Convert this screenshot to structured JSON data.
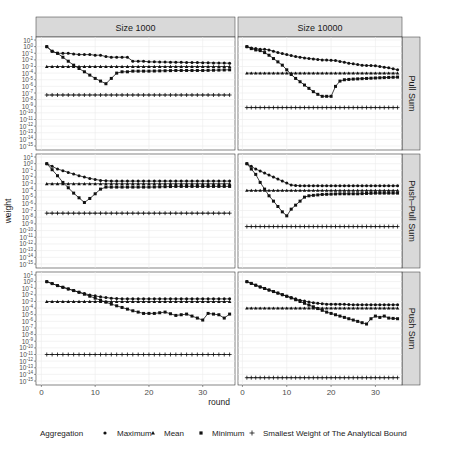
{
  "chart_data": {
    "type": "scatter",
    "xlabel": "round",
    "ylabel": "weight",
    "yscale": "log10",
    "ylim_exp": [
      -15,
      1
    ],
    "yticks_exp": [
      1,
      0,
      -1,
      -2,
      -3,
      -4,
      -5,
      -6,
      -7,
      -8,
      -9,
      -10,
      -11,
      -12,
      -13,
      -14,
      -15
    ],
    "xticks": [
      0,
      10,
      20,
      30
    ],
    "xlim": [
      -1,
      36
    ],
    "col_facets": [
      "Size 1000",
      "Size 10000"
    ],
    "row_facets": [
      "Pull Sum",
      "Push–Pull Sum",
      "Push Sum"
    ],
    "legend": {
      "title": "Aggregation",
      "position": "bottom",
      "entries": [
        {
          "name": "Maximum",
          "shape": "circle"
        },
        {
          "name": "Mean",
          "shape": "triangle"
        },
        {
          "name": "Minimum",
          "shape": "square"
        },
        {
          "name": "Smallest Weight of The Analytical Bound",
          "shape": "plus"
        }
      ]
    },
    "rounds": [
      1,
      35
    ],
    "panels": [
      {
        "row": "Pull Sum",
        "col": "Size 1000",
        "mean_exp": -3,
        "bound_exp": -7.3,
        "max_exp_points": [
          [
            1,
            0
          ],
          [
            2,
            -0.7
          ],
          [
            3,
            -1
          ],
          [
            4,
            -1
          ],
          [
            5,
            -1
          ],
          [
            6,
            -1.1
          ],
          [
            7,
            -1.2
          ],
          [
            8,
            -1.2
          ],
          [
            9,
            -1.2
          ],
          [
            10,
            -1.3
          ],
          [
            11,
            -1.3
          ],
          [
            12,
            -1.5
          ],
          [
            13,
            -1.6
          ],
          [
            14,
            -1.6
          ],
          [
            15,
            -1.6
          ],
          [
            16,
            -1.6
          ],
          [
            17,
            -2.2
          ],
          [
            18,
            -2.2
          ],
          [
            19,
            -2.2
          ],
          [
            20,
            -2.3
          ],
          [
            21,
            -2.3
          ],
          [
            35,
            -2.5
          ]
        ],
        "min_exp_points": [
          [
            1,
            0
          ],
          [
            2,
            -0.7
          ],
          [
            3,
            -1
          ],
          [
            4,
            -1.6
          ],
          [
            5,
            -2.2
          ],
          [
            6,
            -2.8
          ],
          [
            7,
            -3.3
          ],
          [
            8,
            -3.8
          ],
          [
            9,
            -4.3
          ],
          [
            10,
            -4.8
          ],
          [
            11,
            -5.2
          ],
          [
            12,
            -5.6
          ],
          [
            13,
            -4.8
          ],
          [
            14,
            -4
          ],
          [
            15,
            -3.8
          ],
          [
            16,
            -3.8
          ],
          [
            17,
            -3.7
          ],
          [
            18,
            -3.7
          ],
          [
            19,
            -3.7
          ],
          [
            20,
            -3.7
          ],
          [
            25,
            -3.6
          ],
          [
            30,
            -3.6
          ],
          [
            35,
            -3.5
          ]
        ]
      },
      {
        "row": "Pull Sum",
        "col": "Size 10000",
        "mean_exp": -4,
        "bound_exp": -9.2,
        "max_exp_points": [
          [
            1,
            0
          ],
          [
            2,
            -0.2
          ],
          [
            3,
            -0.3
          ],
          [
            4,
            -0.4
          ],
          [
            5,
            -0.4
          ],
          [
            6,
            -0.5
          ],
          [
            7,
            -0.7
          ],
          [
            8,
            -0.9
          ],
          [
            10,
            -1.2
          ],
          [
            12,
            -1.5
          ],
          [
            15,
            -1.8
          ],
          [
            18,
            -2
          ],
          [
            21,
            -2.1
          ],
          [
            24,
            -2.5
          ],
          [
            27,
            -2.8
          ],
          [
            30,
            -2.9
          ],
          [
            33,
            -3.2
          ],
          [
            35,
            -3.5
          ]
        ],
        "min_exp_points": [
          [
            1,
            0
          ],
          [
            2,
            -0.3
          ],
          [
            3,
            -0.5
          ],
          [
            4,
            -0.6
          ],
          [
            5,
            -0.9
          ],
          [
            6,
            -1.3
          ],
          [
            7,
            -1.8
          ],
          [
            8,
            -2.3
          ],
          [
            9,
            -2.8
          ],
          [
            10,
            -3.5
          ],
          [
            11,
            -4.2
          ],
          [
            12,
            -4.8
          ],
          [
            13,
            -5.3
          ],
          [
            14,
            -5.8
          ],
          [
            15,
            -6.3
          ],
          [
            16,
            -6.8
          ],
          [
            17,
            -7.2
          ],
          [
            18,
            -7.5
          ],
          [
            19,
            -7.5
          ],
          [
            20,
            -7.5
          ],
          [
            21,
            -6
          ],
          [
            22,
            -5.2
          ],
          [
            23,
            -5
          ],
          [
            25,
            -4.9
          ],
          [
            28,
            -4.8
          ],
          [
            31,
            -4.7
          ],
          [
            35,
            -4.6
          ]
        ]
      },
      {
        "row": "Push–Pull Sum",
        "col": "Size 1000",
        "mean_exp": -3,
        "bound_exp": -7.4,
        "max_exp_points": [
          [
            1,
            0
          ],
          [
            3,
            -0.8
          ],
          [
            5,
            -1.3
          ],
          [
            7,
            -1.8
          ],
          [
            9,
            -2.2
          ],
          [
            11,
            -2.5
          ],
          [
            13,
            -2.6
          ],
          [
            15,
            -2.6
          ],
          [
            20,
            -2.6
          ],
          [
            25,
            -2.6
          ],
          [
            30,
            -2.6
          ],
          [
            35,
            -2.6
          ]
        ],
        "min_exp_points": [
          [
            1,
            0
          ],
          [
            2,
            -0.9
          ],
          [
            3,
            -1.8
          ],
          [
            4,
            -2.8
          ],
          [
            5,
            -3.6
          ],
          [
            6,
            -4.4
          ],
          [
            7,
            -5.1
          ],
          [
            8,
            -5.8
          ],
          [
            9,
            -5.2
          ],
          [
            10,
            -4.5
          ],
          [
            11,
            -3.8
          ],
          [
            12,
            -3.5
          ],
          [
            14,
            -3.5
          ],
          [
            17,
            -3.5
          ],
          [
            20,
            -3.5
          ],
          [
            25,
            -3.4
          ],
          [
            30,
            -3.4
          ],
          [
            35,
            -3.4
          ]
        ]
      },
      {
        "row": "Push–Pull Sum",
        "col": "Size 10000",
        "mean_exp": -4,
        "bound_exp": -9.4,
        "max_exp_points": [
          [
            1,
            0
          ],
          [
            3,
            -0.8
          ],
          [
            5,
            -1.4
          ],
          [
            7,
            -2
          ],
          [
            9,
            -2.6
          ],
          [
            11,
            -3.2
          ],
          [
            13,
            -3.3
          ],
          [
            15,
            -3.3
          ],
          [
            20,
            -3.3
          ],
          [
            25,
            -3.3
          ],
          [
            30,
            -3.3
          ],
          [
            35,
            -3.3
          ]
        ],
        "min_exp_points": [
          [
            1,
            0
          ],
          [
            2,
            -0.8
          ],
          [
            3,
            -1.6
          ],
          [
            4,
            -2.8
          ],
          [
            5,
            -3.8
          ],
          [
            6,
            -4.8
          ],
          [
            7,
            -5.6
          ],
          [
            8,
            -6.4
          ],
          [
            9,
            -7.2
          ],
          [
            10,
            -7.8
          ],
          [
            11,
            -6.8
          ],
          [
            12,
            -6.2
          ],
          [
            13,
            -5.6
          ],
          [
            14,
            -5
          ],
          [
            15,
            -4.8
          ],
          [
            18,
            -4.6
          ],
          [
            22,
            -4.5
          ],
          [
            26,
            -4.5
          ],
          [
            30,
            -4.4
          ],
          [
            35,
            -4.4
          ]
        ]
      },
      {
        "row": "Push Sum",
        "col": "Size 1000",
        "mean_exp": -3,
        "bound_exp": -11,
        "max_exp_points": [
          [
            1,
            0
          ],
          [
            3,
            -0.6
          ],
          [
            5,
            -1.1
          ],
          [
            7,
            -1.6
          ],
          [
            9,
            -2
          ],
          [
            11,
            -2.3
          ],
          [
            13,
            -2.5
          ],
          [
            15,
            -2.6
          ],
          [
            20,
            -2.6
          ],
          [
            25,
            -2.6
          ],
          [
            30,
            -2.6
          ],
          [
            35,
            -2.6
          ]
        ],
        "min_exp_points": [
          [
            1,
            0
          ],
          [
            3,
            -0.6
          ],
          [
            5,
            -1.1
          ],
          [
            7,
            -1.6
          ],
          [
            9,
            -2.2
          ],
          [
            11,
            -2.8
          ],
          [
            13,
            -3.4
          ],
          [
            15,
            -3.9
          ],
          [
            17,
            -4.4
          ],
          [
            19,
            -4.8
          ],
          [
            21,
            -4.8
          ],
          [
            23,
            -4.6
          ],
          [
            25,
            -5.1
          ],
          [
            27,
            -4.9
          ],
          [
            29,
            -5.5
          ],
          [
            30,
            -5.8
          ],
          [
            31,
            -4.8
          ],
          [
            33,
            -5
          ],
          [
            34,
            -5.5
          ],
          [
            35,
            -4.9
          ],
          [
            36,
            -4.7
          ]
        ]
      },
      {
        "row": "Push Sum",
        "col": "Size 10000",
        "mean_exp": -4,
        "bound_exp": -14.5,
        "max_exp_points": [
          [
            1,
            0
          ],
          [
            4,
            -0.8
          ],
          [
            7,
            -1.5
          ],
          [
            10,
            -2.2
          ],
          [
            13,
            -2.8
          ],
          [
            16,
            -3.2
          ],
          [
            19,
            -3.4
          ],
          [
            22,
            -3.4
          ],
          [
            25,
            -3.5
          ],
          [
            30,
            -3.5
          ],
          [
            35,
            -3.5
          ]
        ],
        "min_exp_points": [
          [
            1,
            0
          ],
          [
            4,
            -0.8
          ],
          [
            7,
            -1.5
          ],
          [
            10,
            -2.2
          ],
          [
            13,
            -3
          ],
          [
            16,
            -3.8
          ],
          [
            19,
            -4.6
          ],
          [
            22,
            -5.2
          ],
          [
            25,
            -5.8
          ],
          [
            27,
            -6.2
          ],
          [
            28,
            -6.4
          ],
          [
            29,
            -5.6
          ],
          [
            30,
            -5.2
          ],
          [
            31,
            -5.4
          ],
          [
            32,
            -5.2
          ],
          [
            33,
            -5.5
          ],
          [
            35,
            -5.6
          ]
        ]
      }
    ]
  }
}
